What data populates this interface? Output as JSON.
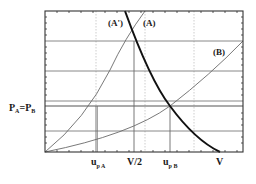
{
  "figure": {
    "type": "diagram",
    "frame": {
      "x0": 45,
      "y0": 11,
      "x1": 243,
      "y1": 152
    },
    "colors": {
      "line": "#6a6a6a",
      "curve_bold": "#111111",
      "grid": "#7a7a7a",
      "dotted": "#b0b0b0",
      "frame": "#333333"
    },
    "curve_labels": {
      "a_prime": "(A')",
      "a": "(A)",
      "b": "(B)"
    },
    "y_label": {
      "pa": "P",
      "pa_sub": "A",
      "eq": "=",
      "pb": "P",
      "pb_sub": "B"
    },
    "x_labels": {
      "upa": "u",
      "upa_sub": "p A",
      "v_half": "V/2",
      "upb": "u",
      "upb_sub": "p B",
      "v": "V"
    },
    "horizontal_lines_y": [
      41,
      71,
      101,
      106,
      131
    ],
    "vertical_lines": [
      {
        "x": 96,
        "style": "solid",
        "from": 106
      },
      {
        "x": 96,
        "style": "dotted",
        "from": 11
      },
      {
        "x": 134,
        "style": "solid",
        "from": 41
      },
      {
        "x": 145,
        "style": "dotted",
        "from": 11
      },
      {
        "x": 170,
        "style": "solid",
        "from": 106
      },
      {
        "x": 194,
        "style": "dotted",
        "from": 11
      }
    ]
  }
}
